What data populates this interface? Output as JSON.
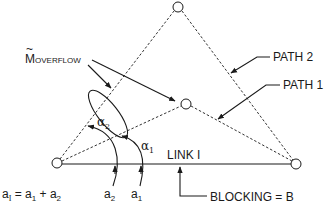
{
  "diagram": {
    "labels": {
      "m_overflow": {
        "main": "M",
        "tilde": "~",
        "sub": "OVERFLOW"
      },
      "path2": "PATH 2",
      "path1": "PATH 1",
      "link": "LINK I",
      "blocking": "BLOCKING = B",
      "alpha2": {
        "main": "α",
        "sub": "2"
      },
      "alpha1": {
        "main": "α",
        "sub": "1"
      },
      "a2": {
        "main": "a",
        "sub": "2"
      },
      "a1": {
        "main": "a",
        "sub": "1"
      },
      "equation": {
        "lhs_main": "a",
        "lhs_sub": "I",
        "eq": " = ",
        "t1_main": "a",
        "t1_sub": "1",
        "plus": " + ",
        "t2_main": "a",
        "t2_sub": "2"
      }
    },
    "nodes": [
      {
        "id": "left",
        "x": 57,
        "y": 163
      },
      {
        "id": "right",
        "x": 296,
        "y": 164
      },
      {
        "id": "top",
        "x": 178,
        "y": 7
      },
      {
        "id": "middle",
        "x": 186,
        "y": 104
      }
    ],
    "colors": {
      "stroke": "#1a1a1a",
      "background": "#ffffff"
    }
  }
}
